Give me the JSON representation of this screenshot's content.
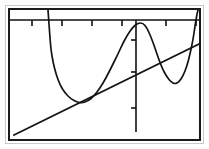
{
  "app": {
    "title": "Graphing Calculator Plot",
    "background_color": "#ffffff",
    "ink_color": "#141414",
    "frame_color": "#1a1a1a",
    "outer_frame_color": "#c9c9c9"
  },
  "chart_data": {
    "type": "line",
    "title": "",
    "subtitle": "",
    "xlabel": "",
    "ylabel": "",
    "grid": false,
    "legend_position": "none",
    "xlim": [
      -4.7,
      4.7
    ],
    "ylim": [
      -3.1,
      3.1
    ],
    "axes": {
      "x_axis_visible": true,
      "x_axis_position_y_px": 10,
      "y_axis_visible": true,
      "y_axis_position_x_px": 126,
      "x_tick_count": 6,
      "x_tick_positions_px": [
        22,
        52,
        82,
        112,
        156,
        186
      ],
      "y_tick_count": 3,
      "y_tick_positions_px": [
        30,
        62,
        98
      ]
    },
    "series": [
      {
        "name": "curve",
        "kind": "oscillating-curve",
        "stroke": "#141414",
        "points_px": [
          [
            38,
            0
          ],
          [
            39,
            14
          ],
          [
            40,
            28
          ],
          [
            41,
            40
          ],
          [
            43,
            52
          ],
          [
            46,
            64
          ],
          [
            50,
            75
          ],
          [
            55,
            83
          ],
          [
            61,
            89
          ],
          [
            67,
            92
          ],
          [
            72,
            93
          ],
          [
            78,
            91
          ],
          [
            84,
            86
          ],
          [
            90,
            78
          ],
          [
            96,
            68
          ],
          [
            102,
            56
          ],
          [
            108,
            44
          ],
          [
            113,
            33
          ],
          [
            118,
            24
          ],
          [
            123,
            17
          ],
          [
            128,
            13
          ],
          [
            133,
            13
          ],
          [
            137,
            18
          ],
          [
            141,
            27
          ],
          [
            145,
            38
          ],
          [
            149,
            50
          ],
          [
            153,
            60
          ],
          [
            157,
            67
          ],
          [
            161,
            72
          ],
          [
            165,
            74
          ],
          [
            169,
            72
          ],
          [
            173,
            66
          ],
          [
            177,
            56
          ],
          [
            180,
            44
          ],
          [
            183,
            30
          ],
          [
            185,
            16
          ],
          [
            187,
            4
          ],
          [
            188,
            0
          ]
        ]
      },
      {
        "name": "line",
        "kind": "straight-line",
        "stroke": "#141414",
        "points_px": [
          [
            4,
            125
          ],
          [
            189,
            34
          ]
        ],
        "slope_px": -0.492,
        "intercept_px": 127
      }
    ],
    "annotations": []
  },
  "elements": {
    "x_axis_name": "x-axis",
    "y_axis_name": "y-axis",
    "curve_name": "curve-trace",
    "line_name": "line-trace"
  }
}
